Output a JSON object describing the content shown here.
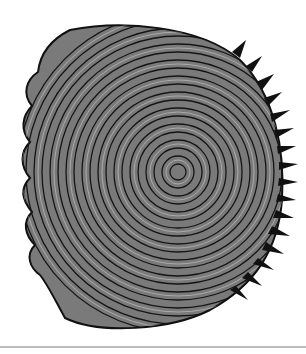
{
  "image": {
    "subject": "fish scale illustration",
    "description": "Engraving-style scientific illustration of a ctenoid fish scale with concentric growth rings (circuli), scalloped lobed anterior margin on the left, and a field of spines (ctenii) along the right posterior edge",
    "colors": {
      "background": "#ffffff",
      "ink": "#1a1a1a",
      "mid": "#6e6e6e",
      "rule": "#bdbdbd"
    }
  }
}
